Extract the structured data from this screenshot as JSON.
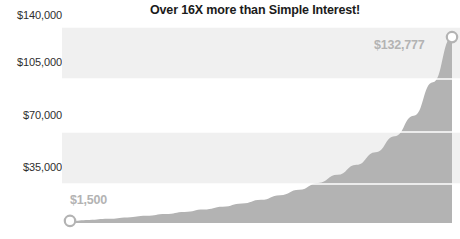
{
  "chart": {
    "title": "Over 16X more than Simple Interest!",
    "type": "area"
  },
  "chart_data": {
    "type": "area",
    "title": "Over 16X more than Simple Interest!",
    "xlabel": "",
    "ylabel": "",
    "ylim": [
      0,
      140000
    ],
    "yticks": [
      35000,
      70000,
      105000,
      140000
    ],
    "ytick_labels": [
      "$35,000",
      "$70,000",
      "$105,000",
      "$140,000"
    ],
    "grid": true,
    "legend": false,
    "series": [
      {
        "name": "Compound Interest",
        "x": [
          0,
          1,
          2,
          3,
          4,
          5,
          6,
          7,
          8,
          9,
          10,
          11,
          12,
          13,
          14,
          15,
          16,
          17,
          18,
          19,
          20
        ],
        "values": [
          1500,
          2200,
          3000,
          4000,
          5100,
          6400,
          7900,
          9600,
          11600,
          13900,
          16600,
          19900,
          23800,
          28600,
          34400,
          41600,
          50600,
          62000,
          76600,
          100500,
          132777
        ],
        "color": "#b3b3b3"
      }
    ],
    "annotations": [
      {
        "name": "start-point",
        "label": "$1,500",
        "value": 1500,
        "x_index": 0
      },
      {
        "name": "end-point",
        "label": "$132,777",
        "value": 132777,
        "x_index": 20
      }
    ]
  },
  "labels": {
    "start": "$1,500",
    "end": "$132,777"
  },
  "axis": {
    "y": [
      {
        "label": "$140,000",
        "value": 140000
      },
      {
        "label": "$105,000",
        "value": 105000
      },
      {
        "label": "$70,000",
        "value": 70000
      },
      {
        "label": "$35,000",
        "value": 35000
      }
    ]
  },
  "colors": {
    "area_fill": "#b3b3b3",
    "band": "#f0f0f0",
    "gridline": "#ffffff",
    "title_text": "#1b1b1b",
    "tick_text": "#2e2e2e",
    "label_text": "#b3b3b3",
    "background": "#ffffff"
  }
}
